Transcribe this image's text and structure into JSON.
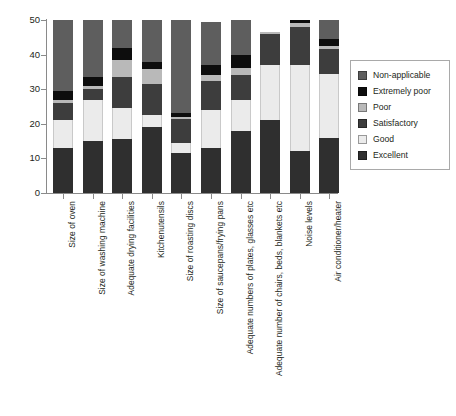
{
  "chart_data": {
    "type": "bar",
    "subtype": "stacked-bar",
    "title": "",
    "subtitle": "",
    "xlabel": "",
    "ylabel": "",
    "ylim": [
      0,
      50
    ],
    "ytick_labels": [
      "0",
      "10",
      "20",
      "30",
      "40",
      "50"
    ],
    "ytick_values": [
      0,
      10,
      20,
      30,
      40,
      50
    ],
    "grid": false,
    "legend_position": "right",
    "stack_order_bottom_to_top": [
      "Excellent",
      "Good",
      "Satisfactory",
      "Poor",
      "Extremely poor",
      "Non-applicable"
    ],
    "categories": [
      "Size of oven",
      "Size of washing machine",
      "Adequate drying facilities",
      "Kitchenutensils",
      "Size of roasting discs",
      "Size of saucepans/frying pans",
      "Adequate numbers of plates, glasses etc",
      "Adequate number of chairs, beds, blankets etc",
      "Noise levels",
      "Air conditioner/heater"
    ],
    "series": [
      {
        "name": "Excellent",
        "color": "#2f2f2f",
        "values": [
          13,
          15,
          15.5,
          19.5,
          11.5,
          13,
          18,
          21,
          12,
          16
        ]
      },
      {
        "name": "Good",
        "color": "#ebebeb",
        "values": [
          8,
          12,
          9,
          3.5,
          3,
          11,
          9,
          16,
          25,
          18.5
        ]
      },
      {
        "name": "Satisfactory",
        "color": "#3d3d3d",
        "values": [
          5,
          3,
          9,
          9,
          7,
          8.5,
          7,
          9,
          11,
          7
        ]
      },
      {
        "name": "Poor",
        "color": "#b9b9b9",
        "values": [
          1,
          1,
          5,
          4.5,
          0.5,
          1.5,
          2,
          0.5,
          1,
          1
        ]
      },
      {
        "name": "Extremely poor",
        "color": "#0d0d0d",
        "values": [
          2.5,
          2.5,
          3.5,
          2,
          1,
          3,
          4,
          0,
          1,
          2
        ]
      },
      {
        "name": "Non-applicable",
        "color": "#5e5e5e",
        "values": [
          20.5,
          16.5,
          8,
          12.5,
          27,
          12.5,
          10,
          0,
          0,
          5.5
        ]
      }
    ],
    "bar_totals": [
      50,
      50,
      50,
      51,
      50,
      49.5,
      50,
      46.5,
      50,
      50
    ]
  },
  "legend": {
    "items": [
      {
        "label": "Non-applicable",
        "color": "#5e5e5e"
      },
      {
        "label": "Extremely poor",
        "color": "#0d0d0d"
      },
      {
        "label": "Poor",
        "color": "#b9b9b9"
      },
      {
        "label": "Satisfactory",
        "color": "#3d3d3d"
      },
      {
        "label": "Good",
        "color": "#ebebeb"
      },
      {
        "label": "Excellent",
        "color": "#2f2f2f"
      }
    ]
  }
}
